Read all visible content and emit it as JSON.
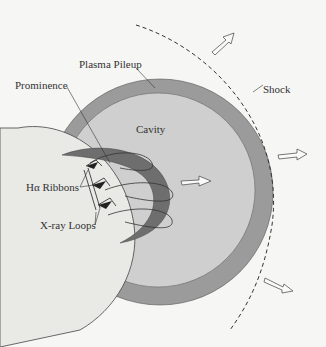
{
  "diagram": {
    "type": "CME schematic",
    "labels": {
      "plasma_pileup": "Plasma Pileup",
      "prominence": "Prominence",
      "cavity": "Cavity",
      "shock": "Shock",
      "ha_ribbons": "Hα Ribbons",
      "xray_loops": "X-ray Loops"
    },
    "colors": {
      "background": "#f6f6f4",
      "sun": "#e9e9e6",
      "pileup": "#9b9b9b",
      "cavity": "#cfcfcf",
      "prominence": "#6e6e6e",
      "line": "#3a3a3a"
    }
  }
}
